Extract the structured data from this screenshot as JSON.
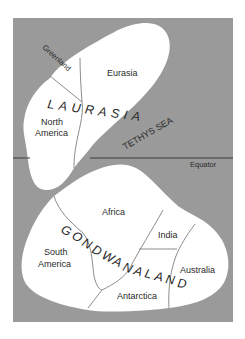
{
  "map": {
    "colors": {
      "ocean": "#9a9a9a",
      "land": "#ffffff",
      "border": "#8c8c8c",
      "equator": "#3a3a3a",
      "text": "#2a2a2a"
    },
    "supercontinents": {
      "north": "LAURASIA",
      "south": "GONDWANALAND"
    },
    "landmasses": {
      "greenland": "Greenland",
      "eurasia": "Eurasia",
      "north_america_1": "North",
      "north_america_2": "America",
      "africa": "Africa",
      "south_america_1": "South",
      "south_america_2": "America",
      "india": "India",
      "australia": "Australia",
      "antarctica": "Antarctica"
    },
    "sea": "TETHYS SEA",
    "equator_label": "Equator",
    "gondwana_letters": [
      "G",
      "O",
      "N",
      "D",
      "W",
      "A",
      "N",
      "A",
      "L",
      "A",
      "N",
      "D"
    ]
  }
}
